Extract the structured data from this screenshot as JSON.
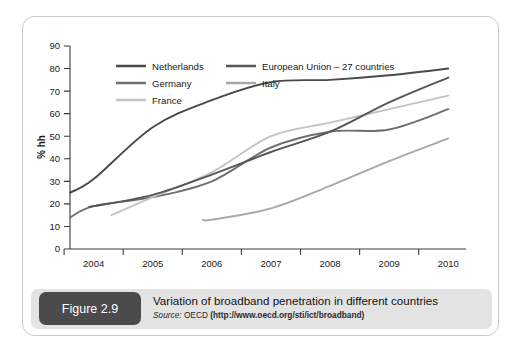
{
  "figure": {
    "badge_label": "Figure 2.9",
    "caption_title": "Variation of broadband penetration in different countries",
    "source_label": "Source:",
    "source_org": "OECD",
    "source_url": "(http://www.oecd.org/sti/ict/broadband)"
  },
  "colors": {
    "netherlands": "#4a4a4a",
    "germany": "#6f6f6f",
    "france": "#c3c3c3",
    "european_union": "#565656",
    "italy": "#a8a8a8",
    "axis": "#3a3a3a",
    "panel_border": "#c9c9c9",
    "caption_band": "#e3e3e3",
    "badge_bg": "#4b4b4b"
  },
  "chart_data": {
    "type": "line",
    "title": "Variation of broadband penetration in different countries",
    "xlabel": "",
    "ylabel": "% hh",
    "xlim": [
      2003.6,
      2010.3
    ],
    "ylim": [
      0,
      90
    ],
    "grid": false,
    "legend_position": "top-left-inside",
    "x_ticks": [
      "2004",
      "2005",
      "2006",
      "2007",
      "2008",
      "2009",
      "2010"
    ],
    "y_ticks": [
      "0",
      "10",
      "20",
      "30",
      "40",
      "50",
      "60",
      "70",
      "80",
      "90"
    ],
    "x": [
      2004,
      2005,
      2006,
      2007,
      2008,
      2009,
      2010
    ],
    "series": [
      {
        "name": "Netherlands",
        "color": "#4a4a4a",
        "x_start": 2003.6,
        "values": [
          31,
          54,
          66,
          74,
          75,
          77,
          80
        ],
        "start_value": 25
      },
      {
        "name": "Germany",
        "color": "#6f6f6f",
        "x_start": 2003.6,
        "values": [
          19,
          23,
          30,
          45,
          52,
          53,
          62
        ],
        "start_value": 14
      },
      {
        "name": "France",
        "color": "#c3c3c3",
        "x_start": 2004.3,
        "values": [
          16,
          23,
          34,
          50,
          56,
          62,
          68
        ],
        "start_value": 15
      },
      {
        "name": "European Union – 27 countries",
        "color": "#565656",
        "x_start": 2004.0,
        "values": [
          19,
          24,
          33,
          43,
          52,
          65,
          76
        ],
        "start_value": 19
      },
      {
        "name": "Italy",
        "color": "#a8a8a8",
        "x_start": 2005.85,
        "values": [
          null,
          null,
          13,
          18,
          28,
          39,
          49
        ],
        "start_value": 13
      }
    ],
    "legend": [
      {
        "label": "Netherlands",
        "color": "#4a4a4a"
      },
      {
        "label": "European Union – 27 countries",
        "color": "#565656"
      },
      {
        "label": "Germany",
        "color": "#6f6f6f"
      },
      {
        "label": "Italy",
        "color": "#a8a8a8"
      },
      {
        "label": "France",
        "color": "#c3c3c3"
      }
    ]
  }
}
